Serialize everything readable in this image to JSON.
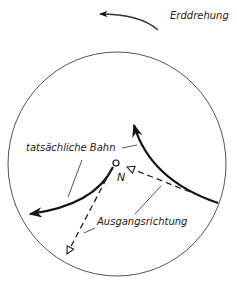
{
  "diagram": {
    "labels": {
      "earth_rotation": "Erddrehung",
      "actual_path": "tatsächliche Bahn",
      "initial_direction": "Ausgangsrichtung",
      "pole": "N"
    },
    "elements": [
      {
        "id": "earth-rotation-arrow",
        "type": "curved-arrow",
        "direction": "counterclockwise (right to left)"
      },
      {
        "id": "earth-disc",
        "type": "circle",
        "meaning": "Erde von oben (Nordpol)"
      },
      {
        "id": "north-pole",
        "type": "point",
        "label": "N"
      },
      {
        "id": "actual-path-left",
        "type": "solid-curved-arrow",
        "from": "N",
        "deflection": "rechts"
      },
      {
        "id": "actual-path-right",
        "type": "solid-curved-arrow",
        "from": "Rand",
        "deflection": "rechts"
      },
      {
        "id": "initial-direction-left",
        "type": "dashed-arrow",
        "from": "N"
      },
      {
        "id": "initial-direction-right",
        "type": "dashed-arrow",
        "to": "N"
      }
    ],
    "colors": {
      "line": "#111111",
      "background": "#ffffff"
    }
  }
}
